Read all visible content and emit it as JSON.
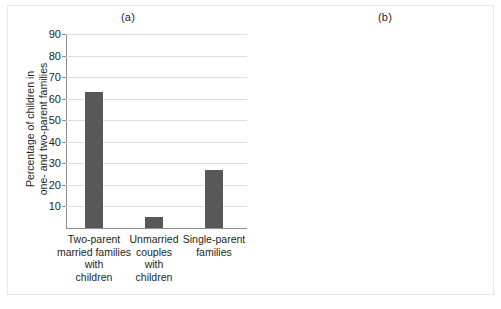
{
  "figure": {
    "background_color": "#ffffff",
    "bar_color": "#585858",
    "grid_color": "#dedede",
    "axis_color": "#8d8d8d"
  },
  "chart_data": [
    {
      "type": "bar",
      "title": "(a)",
      "xlabel": "",
      "ylabel": "Percentage of children in\none- and two-parent families",
      "ylim": [
        0,
        90
      ],
      "yticks": [
        10,
        20,
        30,
        40,
        50,
        60,
        70,
        80,
        90
      ],
      "ytick_labels": [
        "10",
        "20",
        "30",
        "40",
        "50",
        "60",
        "70",
        "80",
        "90"
      ],
      "grid": true,
      "legend": "none",
      "categories": [
        "Two-parent\nmarried families\nwith\nchildren",
        "Unmarried\ncouples\nwith\nchildren",
        "Single-parent\nfamilies"
      ],
      "values": [
        63,
        5,
        27
      ]
    },
    {
      "type": "bar",
      "title": "(b)",
      "xlabel": "",
      "ylabel": "Percentage of children living\nunder poverty line",
      "ylim": [
        0,
        90
      ],
      "yticks": [
        10,
        20,
        30,
        40,
        50,
        60,
        70,
        80,
        90
      ],
      "ytick_labels": [
        "10",
        "20",
        "30",
        "40",
        "50",
        "60",
        "70",
        "80",
        "90"
      ],
      "grid": true,
      "legend": "none",
      "categories": [
        "Single-parent\nfamilies",
        "Two-parent\nmarried families"
      ],
      "values": [
        40,
        9
      ]
    }
  ]
}
